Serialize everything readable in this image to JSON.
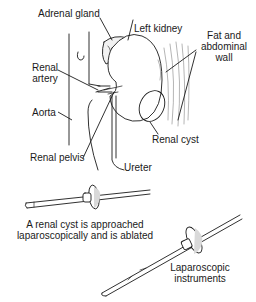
{
  "diagram": {
    "labels": {
      "adrenal_gland": "Adrenal gland",
      "left_kidney": "Left kidney",
      "fat_wall_1": "Fat and",
      "fat_wall_2": "abdominal",
      "fat_wall_3": "wall",
      "renal_artery_1": "Renal",
      "renal_artery_2": "artery",
      "aorta": "Aorta",
      "renal_cyst": "Renal cyst",
      "renal_pelvis": "Renal pelvis",
      "ureter": "Ureter",
      "instruments_1": "Laparoscopic",
      "instruments_2": "instruments"
    },
    "caption": {
      "line1": "A renal cyst is approached",
      "line2": "laparoscopically and is ablated"
    },
    "colors": {
      "line": "#1a1a1a",
      "shade": "#d9d9d9",
      "background": "#ffffff"
    }
  }
}
